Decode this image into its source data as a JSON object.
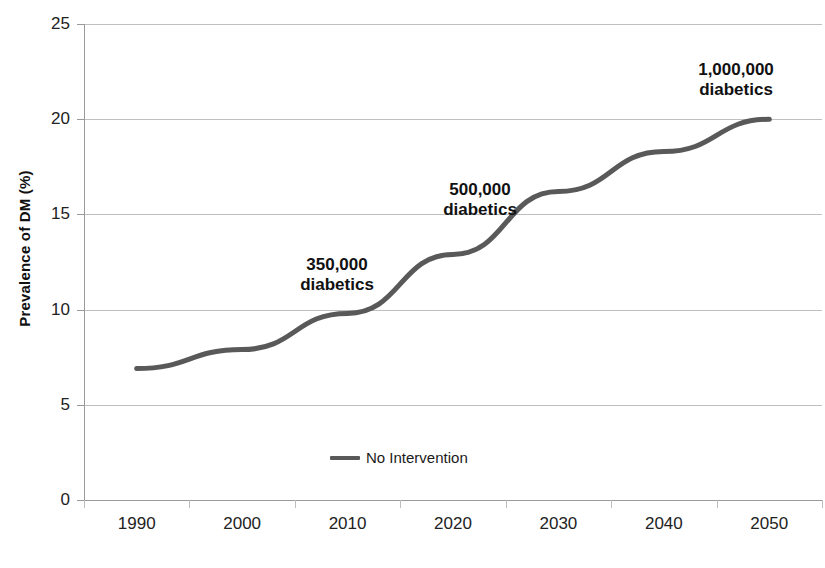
{
  "chart_data": {
    "type": "line",
    "title": "",
    "xlabel": "",
    "ylabel": "Prevalence of DM (%)",
    "categories": [
      "1990",
      "2000",
      "2010",
      "2020",
      "2030",
      "2040",
      "2050"
    ],
    "series": [
      {
        "name": "No Intervention",
        "color": "#595959",
        "values": [
          6.9,
          7.9,
          9.8,
          12.9,
          16.2,
          18.3,
          20.0
        ]
      }
    ],
    "ylim": [
      0,
      25
    ],
    "yticks": [
      0,
      5,
      10,
      15,
      20,
      25
    ],
    "ytick_labels": [
      "0",
      "5",
      "10",
      "15",
      "20",
      "25"
    ],
    "grid": "horizontal",
    "legend_position": "bottom-center",
    "annotations": [
      {
        "text": "350,000\ndiabetics",
        "at_category": "2010",
        "value": 350000
      },
      {
        "text": "500,000\ndiabetics",
        "at_category": "2020",
        "value": 500000
      },
      {
        "text": "1,000,000\ndiabetics",
        "at_category": "2050",
        "value": 1000000
      }
    ]
  },
  "colors": {
    "series_line": "#595959",
    "gridline": "#bfbfbf",
    "axis": "#9a9a9a",
    "text": "#1a1a1a",
    "background": "#ffffff"
  }
}
